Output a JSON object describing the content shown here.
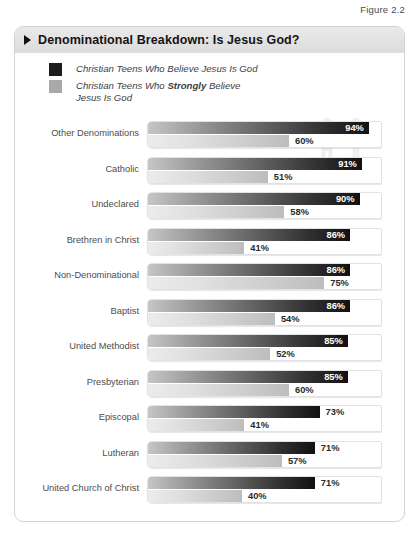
{
  "figure_caption": "Figure 2.2",
  "title": "Denominational Breakdown: Is Jesus God?",
  "title_bullet_icon": "triangle-right-icon",
  "legend": {
    "items": [
      {
        "swatch_color": "#1c1c1c",
        "label": "Christian Teens Who Believe Jesus Is God",
        "label_pre": "Christian Teens Who Believe Jesus Is God",
        "label_bold": "",
        "label_post": ""
      },
      {
        "swatch_color": "#a9a9a9",
        "label": "Christian Teens Who Strongly Believe Jesus Is God",
        "label_pre": "Christian Teens Who ",
        "label_bold": "Strongly",
        "label_post": " Believe\nJesus Is God"
      }
    ]
  },
  "decorative_icons": [
    "person-female-icon",
    "person-male-icon"
  ],
  "colors": {
    "believe_dark": "#1c1c1c",
    "strongly_gray": "#a9a9a9",
    "title_bar": "#e2e2e2",
    "card_border": "#d2d2d2",
    "label_text": "#4d4d4d"
  },
  "chart_data": {
    "type": "bar",
    "title": "Denominational Breakdown: Is Jesus God?",
    "xlabel": "",
    "ylabel": "",
    "xlim": [
      0,
      100
    ],
    "grid": false,
    "legend_position": "top-left",
    "orientation": "horizontal",
    "value_suffix": "%",
    "categories": [
      "Other Denominations",
      "Catholic",
      "Undeclared",
      "Brethren in Christ",
      "Non-Denominational",
      "Baptist",
      "United Methodist",
      "Presbyterian",
      "Episcopal",
      "Lutheran",
      "United Church of Christ"
    ],
    "series": [
      {
        "name": "Christian Teens Who Believe Jesus Is God",
        "color": "#1c1c1c",
        "values": [
          94,
          91,
          90,
          86,
          86,
          86,
          85,
          85,
          73,
          71,
          71
        ]
      },
      {
        "name": "Christian Teens Who Strongly Believe Jesus Is God",
        "color": "#a9a9a9",
        "values": [
          60,
          51,
          58,
          41,
          75,
          54,
          52,
          60,
          41,
          57,
          40
        ]
      }
    ]
  }
}
